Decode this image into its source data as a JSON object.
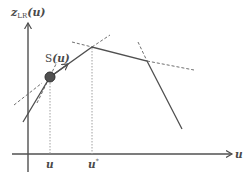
{
  "diagram": {
    "y_axis": {
      "label_main": "z",
      "label_sub": "LR",
      "label_arg": "(u)"
    },
    "x_axis": {
      "label": "u"
    },
    "point": {
      "label_main": "S",
      "label_arg": "(u)"
    },
    "ticks": [
      {
        "label": "u",
        "superscript": ""
      },
      {
        "label": "u",
        "superscript": "*"
      }
    ],
    "colors": {
      "axis": "#505050",
      "curve": "#505050",
      "dashed": "#707070",
      "dotted": "#a0a0a0",
      "point_fill": "#505050",
      "point_stroke": "#303030",
      "text": "#4a4a4a"
    }
  }
}
